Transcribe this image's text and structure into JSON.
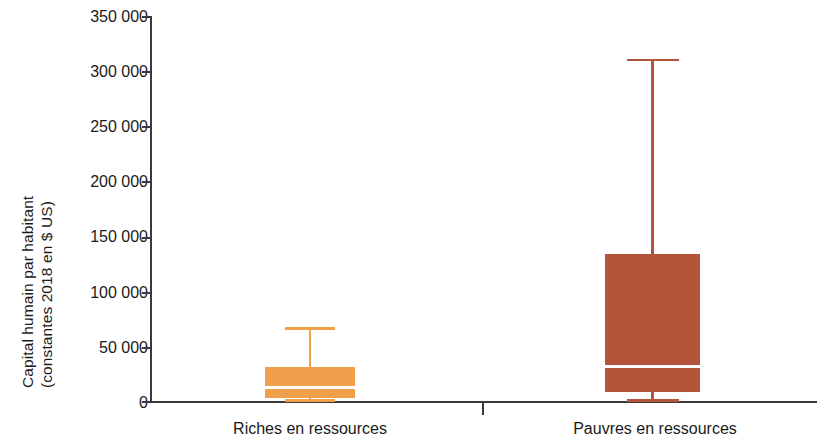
{
  "chart_data": {
    "type": "box",
    "title": "",
    "xlabel": "",
    "ylabel_line1": "Capital humain par habitant",
    "ylabel_line2": "(constantes 2018 en $ US)",
    "ylim": [
      0,
      350000
    ],
    "grid": false,
    "legend": "none",
    "y_ticks": [
      {
        "value": 350000,
        "label": "350 000"
      },
      {
        "value": 300000,
        "label": "300 000"
      },
      {
        "value": 250000,
        "label": "250 000"
      },
      {
        "value": 200000,
        "label": "200 000"
      },
      {
        "value": 150000,
        "label": "150 000"
      },
      {
        "value": 100000,
        "label": "100 000"
      },
      {
        "value": 50000,
        "label": "50 000"
      },
      {
        "value": 0,
        "label": "0"
      }
    ],
    "categories": [
      "Riches en ressources",
      "Pauvres en ressources"
    ],
    "boxes": [
      {
        "category": "Riches en ressources",
        "color": "#F0A04B",
        "whisker_low": 1500,
        "q1": 2700,
        "median": 12700,
        "q3": 30800,
        "whisker_high": 67000
      },
      {
        "category": "Pauvres en ressources",
        "color": "#B4543A",
        "whisker_low": 1800,
        "q1": 8200,
        "median": 31800,
        "q3": 133400,
        "whisker_high": 311000
      }
    ]
  },
  "axis": {
    "axis_color": "#3a3a3a"
  }
}
